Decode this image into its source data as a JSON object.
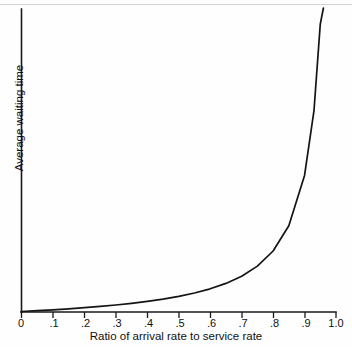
{
  "chart_data": {
    "type": "line",
    "title": "",
    "xlabel": "Ratio of arrival rate to service rate",
    "ylabel": "Average waiting time",
    "xlim": [
      0,
      1.0
    ],
    "ylim": [
      0,
      20
    ],
    "grid": false,
    "legend": null,
    "xticks": [
      "0",
      ".1",
      ".2",
      ".3",
      ".4",
      ".5",
      ".6",
      ".7",
      ".8",
      ".9",
      "1.0"
    ],
    "xtick_values": [
      0,
      0.1,
      0.2,
      0.3,
      0.4,
      0.5,
      0.6,
      0.7,
      0.8,
      0.9,
      1.0
    ],
    "yticks": [],
    "series": [
      {
        "name": "Average waiting time",
        "formula": "rho / (1 - rho)",
        "color": "#141414",
        "x": [
          0,
          0.05,
          0.1,
          0.15,
          0.2,
          0.25,
          0.3,
          0.35,
          0.4,
          0.45,
          0.5,
          0.55,
          0.6,
          0.65,
          0.7,
          0.75,
          0.8,
          0.85,
          0.9,
          0.93,
          0.95,
          0.96,
          0.97,
          0.975,
          0.98,
          0.985,
          0.99,
          0.993,
          0.995
        ],
        "values": [
          0,
          0.053,
          0.111,
          0.176,
          0.25,
          0.333,
          0.429,
          0.538,
          0.667,
          0.818,
          1.0,
          1.222,
          1.5,
          1.857,
          2.333,
          3.0,
          4.0,
          5.667,
          9.0,
          13.286,
          19.0,
          24.0,
          32.333,
          39.0,
          49.0,
          65.667,
          99.0,
          141.857,
          199.0
        ]
      }
    ],
    "annotations": [
      {
        "text": "vertical asymptote at ratio = 1.0",
        "x": 1.0
      }
    ]
  },
  "axis": {
    "x_title": "Ratio of arrival rate to service rate",
    "y_title": "Average waiting time",
    "tick_labels": [
      "0",
      ".1",
      ".2",
      ".3",
      ".4",
      ".5",
      ".6",
      ".7",
      ".8",
      ".9",
      "1.0"
    ]
  }
}
